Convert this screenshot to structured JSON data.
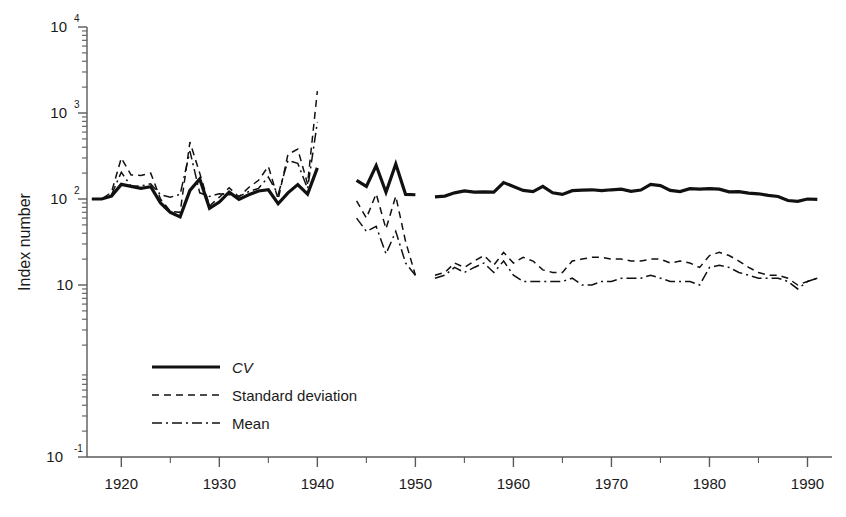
{
  "chart_data": {
    "type": "line",
    "title": "",
    "xlabel": "",
    "ylabel": "Index number",
    "xlim": [
      1916.5,
      1992.5
    ],
    "ylim": [
      0.1,
      10000
    ],
    "yscale": "log",
    "grid": false,
    "legend_position": "inside-lower-left",
    "ytick_labels": [
      "10",
      "10",
      "10",
      "10",
      "10"
    ],
    "ytick_exponents": [
      "4",
      "3",
      "2",
      "",
      "-1"
    ],
    "ytick_values": [
      10000,
      1000,
      100,
      10,
      0.1
    ],
    "xtick_labels": [
      "1920",
      "1930",
      "1940",
      "1950",
      "1960",
      "1970",
      "1980",
      "1990"
    ],
    "xtick_values": [
      1920,
      1930,
      1940,
      1950,
      1960,
      1970,
      1980,
      1990
    ],
    "xtick_minor_values": [
      1925,
      1935,
      1945,
      1955,
      1965,
      1975,
      1985
    ],
    "legend": [
      {
        "name": "CV",
        "style": "solid-thick",
        "italic": true
      },
      {
        "name": "Standard deviation",
        "style": "dashed",
        "italic": false
      },
      {
        "name": "Mean",
        "style": "dash-dot",
        "italic": false
      }
    ],
    "series": [
      {
        "name": "CV",
        "style": "solid-thick",
        "segments": [
          {
            "x": [
              1917,
              1918,
              1919,
              1920,
              1921,
              1922,
              1923,
              1924,
              1925,
              1926,
              1927,
              1928,
              1929,
              1930,
              1931,
              1932,
              1933,
              1934,
              1935,
              1936,
              1937,
              1938,
              1939,
              1940
            ],
            "y": [
              100,
              100,
              108,
              148,
              140,
              133,
              139,
              90,
              70,
              62,
              126,
              171,
              78,
              92,
              120,
              99,
              112,
              124,
              128,
              88,
              118,
              147,
              114,
              230,
              237
            ]
          },
          {
            "x": [
              1944,
              1945,
              1946,
              1947,
              1948,
              1949,
              1950
            ],
            "y": [
              165,
              140,
              245,
              120,
              255,
              113,
              112
            ]
          },
          {
            "x": [
              1952,
              1953,
              1954,
              1955,
              1956,
              1957,
              1958,
              1959,
              1960,
              1961,
              1962,
              1963,
              1964,
              1965,
              1966,
              1967,
              1968,
              1969,
              1970,
              1971,
              1972,
              1973,
              1974,
              1975,
              1976,
              1977,
              1978,
              1979,
              1980,
              1981,
              1982,
              1983,
              1984,
              1985,
              1986,
              1987,
              1988,
              1989,
              1990,
              1991
            ],
            "y": [
              106,
              108,
              118,
              124,
              120,
              121,
              120,
              155,
              140,
              126,
              122,
              140,
              118,
              113,
              125,
              127,
              128,
              125,
              128,
              130,
              123,
              127,
              148,
              143,
              126,
              122,
              132,
              130,
              132,
              130,
              121,
              122,
              117,
              115,
              110,
              107,
              96,
              94,
              100,
              99
            ]
          }
        ]
      },
      {
        "name": "Standard deviation",
        "style": "dashed",
        "segments": [
          {
            "x": [
              1917,
              1918,
              1919,
              1920,
              1921,
              1922,
              1923,
              1924,
              1925,
              1926,
              1927,
              1928,
              1929,
              1930,
              1931,
              1932,
              1933,
              1934,
              1935,
              1936,
              1937,
              1938,
              1939,
              1940
            ],
            "y": [
              100,
              100,
              120,
              300,
              190,
              188,
              200,
              100,
              72,
              70,
              460,
              200,
              83,
              105,
              135,
              106,
              136,
              165,
              240,
              99,
              330,
              380,
              150,
              1800,
              640
            ]
          },
          {
            "x": [
              1944,
              1945,
              1946,
              1947,
              1948,
              1949,
              1950
            ],
            "y": [
              95,
              60,
              115,
              45,
              108,
              32,
              13
            ]
          },
          {
            "x": [
              1952,
              1953,
              1954,
              1955,
              1956,
              1957,
              1958,
              1959,
              1960,
              1961,
              1962,
              1963,
              1964,
              1965,
              1966,
              1967,
              1968,
              1969,
              1970,
              1971,
              1972,
              1973,
              1974,
              1975,
              1976,
              1977,
              1978,
              1979,
              1980,
              1981,
              1982,
              1983,
              1984,
              1985,
              1986,
              1987,
              1988,
              1989,
              1990,
              1991
            ],
            "y": [
              13,
              14,
              18,
              16,
              19,
              22,
              17,
              24,
              18,
              21,
              19,
              15,
              14,
              14,
              19,
              20,
              21,
              21,
              20,
              20,
              19,
              19,
              20,
              20,
              18,
              19,
              18,
              16,
              22,
              24,
              22,
              19,
              16,
              14,
              13,
              13,
              12,
              10,
              11,
              12
            ]
          }
        ]
      },
      {
        "name": "Mean",
        "style": "dash-dot",
        "segments": [
          {
            "x": [
              1917,
              1918,
              1919,
              1920,
              1921,
              1922,
              1923,
              1924,
              1925,
              1926,
              1927,
              1928,
              1929,
              1930,
              1931,
              1932,
              1933,
              1934,
              1935,
              1936,
              1937,
              1938,
              1939,
              1940
            ],
            "y": [
              100,
              100,
              112,
              205,
              140,
              142,
              150,
              112,
              105,
              113,
              360,
              118,
              107,
              115,
              112,
              107,
              122,
              133,
              180,
              113,
              280,
              260,
              132,
              780,
              680
            ]
          },
          {
            "x": [
              1944,
              1945,
              1946,
              1947,
              1948,
              1949,
              1950
            ],
            "y": [
              60,
              42,
              48,
              23,
              42,
              18,
              13
            ]
          },
          {
            "x": [
              1952,
              1953,
              1954,
              1955,
              1956,
              1957,
              1958,
              1959,
              1960,
              1961,
              1962,
              1963,
              1964,
              1965,
              1966,
              1967,
              1968,
              1969,
              1970,
              1971,
              1972,
              1973,
              1974,
              1975,
              1976,
              1977,
              1978,
              1979,
              1980,
              1981,
              1982,
              1983,
              1984,
              1985,
              1986,
              1987,
              1988,
              1989,
              1990,
              1991
            ],
            "y": [
              12,
              13,
              16,
              14,
              16,
              18,
              14,
              19,
              13,
              11,
              11,
              11,
              11,
              11,
              12,
              10,
              10,
              11,
              11,
              12,
              12,
              12,
              13,
              12,
              11,
              11,
              11,
              10,
              16,
              17,
              16,
              14,
              13,
              12,
              12,
              12,
              11,
              9,
              11,
              12
            ]
          }
        ]
      }
    ]
  },
  "axis": {
    "y_title": "Index number"
  }
}
